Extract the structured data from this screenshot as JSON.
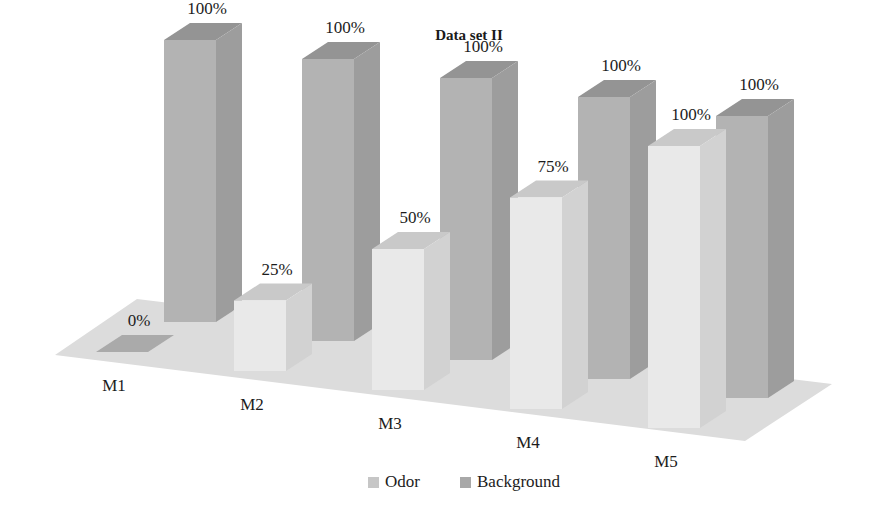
{
  "chart_data": {
    "type": "bar",
    "title": "Data set II",
    "xlabel": "",
    "ylabel": "",
    "ylim": [
      0,
      100
    ],
    "grid": false,
    "legend_position": "bottom",
    "value_suffix": "%",
    "categories": [
      "M1",
      "M2",
      "M3",
      "M4",
      "M5"
    ],
    "series": [
      {
        "name": "Odor",
        "color": "#e9e9e9",
        "top_color": "#c9c9c9",
        "side_color": "#d2d2d2",
        "values": [
          0,
          25,
          50,
          75,
          100
        ],
        "labels": [
          "0%",
          "25%",
          "50%",
          "75%",
          "100%"
        ]
      },
      {
        "name": "Background",
        "color": "#b3b3b3",
        "top_color": "#949494",
        "side_color": "#9d9d9d",
        "values": [
          100,
          100,
          100,
          100,
          100
        ],
        "labels": [
          "100%",
          "100%",
          "100%",
          "100%",
          "100%"
        ]
      }
    ],
    "floor_color": "#dcdcdc",
    "zero_marker_color": "#aaaaaa"
  },
  "legend": {
    "items": [
      {
        "label": "Odor",
        "swatch": "#c6c6c6"
      },
      {
        "label": "Background",
        "swatch": "#a8a8a8"
      }
    ]
  }
}
